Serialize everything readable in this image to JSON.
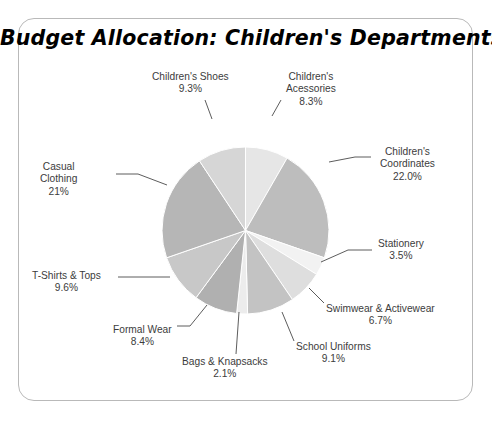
{
  "title": "Budget Allocation: Children's Departments",
  "frame": {
    "border_color": "#b9b9b9",
    "background": "#ffffff"
  },
  "chart_data": {
    "type": "pie",
    "title": "Budget Allocation: Children's Departments",
    "xlabel": "",
    "ylabel": "",
    "legend": "none",
    "labels_position": "outside-with-leader-lines",
    "start_angle_deg": 90,
    "direction": "clockwise",
    "categories": [
      "Children's Acessories",
      "Children's Coordinates",
      "Stationery",
      "Swimwear & Activewear",
      "School Uniforms",
      "Bags & Knapsacks",
      "Formal Wear",
      "T-Shirts & Tops",
      "Casual Clothing",
      "Children's Shoes"
    ],
    "values": [
      8.3,
      22.0,
      3.5,
      6.7,
      9.1,
      2.1,
      8.4,
      9.6,
      21.0,
      9.3
    ],
    "value_labels": [
      "8.3%",
      "22.0%",
      "3.5%",
      "6.7%",
      "9.1%",
      "2.1%",
      "8.4%",
      "9.6%",
      "21%",
      "9.3%"
    ],
    "colors": [
      "#e6e6e6",
      "#bdbdbd",
      "#f2f2f2",
      "#dedede",
      "#c3c3c3",
      "#ececec",
      "#b0b0b0",
      "#c8c8c8",
      "#b6b6b6",
      "#d6d6d6"
    ],
    "units": "percent",
    "total": 100.0
  },
  "slices": [
    {
      "name": "Children's Acessories",
      "percent": "8.3%",
      "color": "#e6e6e6",
      "label_x": 286,
      "label_y": 71,
      "leader": "M 272,116 L 281,100"
    },
    {
      "name": "Children's Coordinates",
      "percent": "22.0%",
      "color": "#bdbdbd",
      "label_x": 380,
      "label_y": 146,
      "leader": "M 329,162 L 355,157 L 371,157"
    },
    {
      "name": "Stationery",
      "percent": "3.5%",
      "color": "#f2f2f2",
      "label_x": 378,
      "label_y": 238,
      "leader": "M 321,262 L 348,250 L 372,250"
    },
    {
      "name": "Swimwear & Activewear",
      "percent": "6.7%",
      "color": "#dedede",
      "label_x": 326,
      "label_y": 303,
      "leader": "M 309,288 L 324,303"
    },
    {
      "name": "School Uniforms",
      "percent": "9.1%",
      "color": "#c3c3c3",
      "label_x": 296,
      "label_y": 341,
      "leader": "M 282,312 L 294,341"
    },
    {
      "name": "Bags & Knapsacks",
      "percent": "2.1%",
      "color": "#ececec",
      "label_x": 182,
      "label_y": 356,
      "leader": "M 239,312 L 236,354"
    },
    {
      "name": "Formal Wear",
      "percent": "8.4%",
      "color": "#b0b0b0",
      "label_x": 113,
      "label_y": 324,
      "leader": "M 207,305 L 190,326 L 177,326"
    },
    {
      "name": "T-Shirts & Tops",
      "percent": "9.6%",
      "color": "#c8c8c8",
      "label_x": 32,
      "label_y": 270,
      "leader": "M 170,277 L 140,277 L 118,277"
    },
    {
      "name": "Casual Clothing",
      "percent": "21%",
      "color": "#b6b6b6",
      "label_x": 40,
      "label_y": 161,
      "leader": "M 167,185 L 138,174 L 116,174"
    },
    {
      "name": "Children's Shoes",
      "percent": "9.3%",
      "color": "#d6d6d6",
      "label_x": 152,
      "label_y": 71,
      "leader": "M 212,119 L 205,100"
    }
  ]
}
